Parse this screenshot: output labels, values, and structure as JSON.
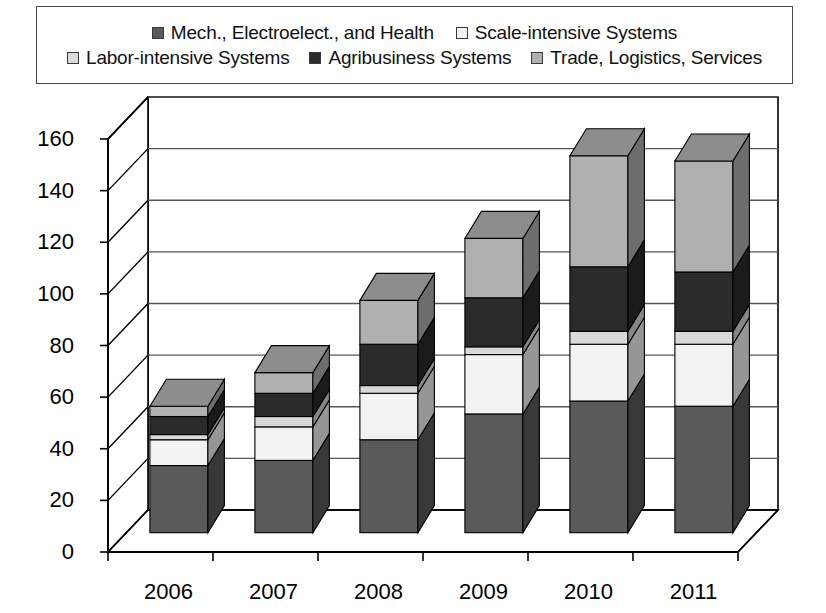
{
  "legend": {
    "rows": [
      [
        {
          "label": "Mech., Electroelect., and Health",
          "color": "#5a5a5a",
          "icon": "legend-swatch"
        },
        {
          "label": "Scale-intensive Systems",
          "color": "#f2f2f2",
          "icon": "legend-swatch"
        }
      ],
      [
        {
          "label": "Labor-intensive Systems",
          "color": "#d9d9d9",
          "icon": "legend-swatch"
        },
        {
          "label": "Agribusiness Systems",
          "color": "#2b2b2b",
          "icon": "legend-swatch"
        },
        {
          "label": "Trade, Logistics, Services",
          "color": "#b0b0b0",
          "icon": "legend-swatch"
        }
      ]
    ]
  },
  "chart_data": {
    "type": "bar",
    "stacked": true,
    "three_d": true,
    "title": "",
    "xlabel": "",
    "ylabel": "",
    "categories": [
      "2006",
      "2007",
      "2008",
      "2009",
      "2010",
      "2011"
    ],
    "ylim": [
      0,
      160
    ],
    "yticks": [
      0,
      20,
      40,
      60,
      80,
      100,
      120,
      140,
      160
    ],
    "ytick_labels": [
      "0",
      "20",
      "40",
      "60",
      "80",
      "100",
      "120",
      "140",
      "160"
    ],
    "grid": true,
    "legend_position": "top",
    "series": [
      {
        "name": "Mech., Electroelect., and Health",
        "color": "#5a5a5a",
        "values": [
          26,
          28,
          36,
          46,
          51,
          49
        ]
      },
      {
        "name": "Scale-intensive Systems",
        "color": "#f2f2f2",
        "values": [
          10,
          13,
          18,
          23,
          22,
          24
        ]
      },
      {
        "name": "Labor-intensive Systems",
        "color": "#d9d9d9",
        "values": [
          2,
          4,
          3,
          3,
          5,
          5
        ]
      },
      {
        "name": "Agribusiness Systems",
        "color": "#2b2b2b",
        "values": [
          7,
          9,
          16,
          19,
          25,
          23
        ]
      },
      {
        "name": "Trade, Logistics, Services",
        "color": "#b0b0b0",
        "values": [
          4,
          8,
          17,
          23,
          43,
          43
        ]
      }
    ],
    "totals": [
      49,
      62,
      90,
      114,
      146,
      144
    ]
  },
  "axis": {
    "x_tick_labels": [
      "2006",
      "2007",
      "2008",
      "2009",
      "2010",
      "2011"
    ],
    "y_tick_labels": [
      "0",
      "20",
      "40",
      "60",
      "80",
      "100",
      "120",
      "140",
      "160"
    ]
  },
  "colors": {
    "axis_line": "#000000",
    "grid_line": "#555555",
    "wall": "#ffffff",
    "border": "#4a4a4a"
  }
}
